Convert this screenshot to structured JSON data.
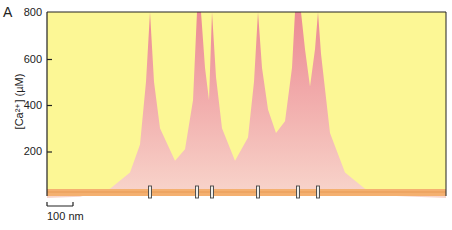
{
  "panel_label": "A",
  "chart_data": {
    "type": "area",
    "title": "",
    "xlabel": "",
    "ylabel": "[Ca2+] (µM)",
    "ylabel_display": "[Ca²⁺] (µM)",
    "ylim": [
      0,
      800
    ],
    "yticks": [
      200,
      400,
      600,
      800
    ],
    "grid": false,
    "legend": null,
    "scale_bar": {
      "label": "100 nm",
      "length_px": 26
    },
    "channels_x_px": [
      150,
      197,
      212,
      258,
      298,
      318
    ],
    "x_px": [
      47,
      80,
      110,
      130,
      140,
      146,
      150,
      154,
      160,
      175,
      185,
      193,
      197,
      201,
      205,
      209,
      212,
      216,
      222,
      235,
      248,
      254,
      258,
      262,
      268,
      276,
      285,
      292,
      295,
      298,
      301,
      305,
      310,
      315,
      318,
      321,
      330,
      345,
      365,
      390,
      446
    ],
    "values_uM": [
      0,
      5,
      40,
      110,
      230,
      500,
      800,
      500,
      300,
      160,
      210,
      420,
      800,
      800,
      560,
      420,
      800,
      520,
      300,
      160,
      260,
      500,
      800,
      560,
      380,
      280,
      330,
      560,
      800,
      800,
      800,
      640,
      480,
      640,
      800,
      620,
      280,
      110,
      40,
      10,
      0
    ],
    "colors": {
      "background": "#fcf795",
      "calcium": "#ee8f97",
      "calcium_base": "#f7d0c6",
      "membrane": "#f4b070",
      "channel": "#444444"
    }
  }
}
